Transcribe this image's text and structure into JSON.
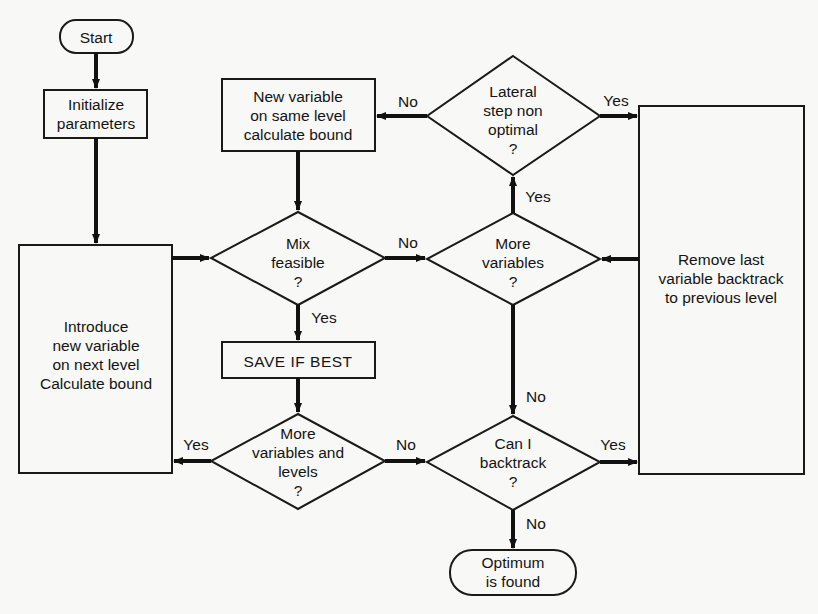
{
  "nodes": {
    "start": {
      "type": "terminator",
      "lines": [
        "Start"
      ]
    },
    "initialize": {
      "type": "process",
      "lines": [
        "Initialize",
        "parameters"
      ]
    },
    "introduce": {
      "type": "process",
      "lines": [
        "Introduce",
        "new variable",
        "on next level",
        "Calculate bound"
      ]
    },
    "new_variable_same_level": {
      "type": "process",
      "lines": [
        "New variable",
        "on same level",
        "calculate bound"
      ]
    },
    "mix_feasible": {
      "type": "decision",
      "lines": [
        "Mix",
        "feasible",
        "?"
      ]
    },
    "save_if_best": {
      "type": "process",
      "lines": [
        "SAVE IF BEST"
      ]
    },
    "more_vars_levels": {
      "type": "decision",
      "lines": [
        "More",
        "variables and",
        "levels",
        "?"
      ]
    },
    "lateral_step": {
      "type": "decision",
      "lines": [
        "Lateral",
        "step non",
        "optimal",
        "?"
      ]
    },
    "more_variables": {
      "type": "decision",
      "lines": [
        "More",
        "variables",
        "?"
      ]
    },
    "can_backtrack": {
      "type": "decision",
      "lines": [
        "Can I",
        "backtrack",
        "?"
      ]
    },
    "remove_last": {
      "type": "process",
      "lines": [
        "Remove last",
        "variable backtrack",
        "to previous level"
      ]
    },
    "optimum": {
      "type": "terminator",
      "lines": [
        "Optimum",
        "is found"
      ]
    }
  },
  "edges": [
    {
      "from": "start",
      "to": "initialize",
      "label": ""
    },
    {
      "from": "initialize",
      "to": "introduce",
      "label": ""
    },
    {
      "from": "introduce",
      "to": "mix_feasible",
      "label": ""
    },
    {
      "from": "new_variable_same_level",
      "to": "mix_feasible",
      "label": ""
    },
    {
      "from": "mix_feasible",
      "to": "more_variables",
      "label": "No"
    },
    {
      "from": "mix_feasible",
      "to": "save_if_best",
      "label": "Yes"
    },
    {
      "from": "save_if_best",
      "to": "more_vars_levels",
      "label": ""
    },
    {
      "from": "more_vars_levels",
      "to": "introduce",
      "label": "Yes"
    },
    {
      "from": "more_vars_levels",
      "to": "can_backtrack",
      "label": "No"
    },
    {
      "from": "more_variables",
      "to": "lateral_step",
      "label": "Yes"
    },
    {
      "from": "more_variables",
      "to": "can_backtrack",
      "label": "No"
    },
    {
      "from": "lateral_step",
      "to": "new_variable_same_level",
      "label": "No"
    },
    {
      "from": "lateral_step",
      "to": "remove_last",
      "label": "Yes"
    },
    {
      "from": "remove_last",
      "to": "more_variables",
      "label": ""
    },
    {
      "from": "can_backtrack",
      "to": "remove_last",
      "label": "Yes"
    },
    {
      "from": "can_backtrack",
      "to": "optimum",
      "label": "No"
    }
  ],
  "edge_labels": {
    "mix_no": "No",
    "mix_yes": "Yes",
    "mvl_yes": "Yes",
    "mvl_no": "No",
    "mv_yes": "Yes",
    "mv_no": "No",
    "lat_no": "No",
    "lat_yes": "Yes",
    "cb_yes": "Yes",
    "cb_no": "No"
  }
}
